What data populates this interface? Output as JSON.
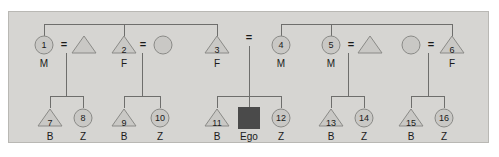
{
  "diagram": {
    "colors": {
      "panel_background": "#d6d5d2",
      "panel_border": "#b9b8b4",
      "shape_fill": "#c9c8c5",
      "shape_stroke": "#8a8a87",
      "ego_fill": "#4a4a4a",
      "line": "#6e6e6c",
      "text": "#1a1a1a"
    },
    "legend": {
      "triangle": "male",
      "circle": "female",
      "filled_square": "ego",
      "equals": "marriage-union"
    },
    "marriage_symbol": "=",
    "generation1": [
      {
        "id": "g1-1",
        "number": "1",
        "kin": "M",
        "shape": "circle",
        "cx": 44,
        "cy": 45
      },
      {
        "id": "g1-s1",
        "number": "",
        "kin": "",
        "shape": "triangle",
        "cx": 84,
        "cy": 45
      },
      {
        "id": "g1-2",
        "number": "2",
        "kin": "F",
        "shape": "triangle",
        "cx": 124,
        "cy": 45
      },
      {
        "id": "g1-s2",
        "number": "",
        "kin": "",
        "shape": "circle",
        "cx": 163,
        "cy": 45
      },
      {
        "id": "g1-3",
        "number": "3",
        "kin": "F",
        "shape": "triangle",
        "cx": 217,
        "cy": 45
      },
      {
        "id": "g1-4",
        "number": "4",
        "kin": "M",
        "shape": "circle",
        "cx": 281,
        "cy": 45
      },
      {
        "id": "g1-5",
        "number": "5",
        "kin": "M",
        "shape": "circle",
        "cx": 331,
        "cy": 45
      },
      {
        "id": "g1-s3",
        "number": "",
        "kin": "",
        "shape": "triangle",
        "cx": 370,
        "cy": 45
      },
      {
        "id": "g1-s4",
        "number": "",
        "kin": "",
        "shape": "circle",
        "cx": 411,
        "cy": 45
      },
      {
        "id": "g1-6",
        "number": "6",
        "kin": "F",
        "shape": "triangle",
        "cx": 452,
        "cy": 45
      }
    ],
    "generation2": [
      {
        "id": "g2-7",
        "number": "7",
        "kin": "B",
        "shape": "triangle",
        "cx": 50,
        "cy": 118
      },
      {
        "id": "g2-8",
        "number": "8",
        "kin": "Z",
        "shape": "circle",
        "cx": 83,
        "cy": 118
      },
      {
        "id": "g2-9",
        "number": "9",
        "kin": "B",
        "shape": "triangle",
        "cx": 124,
        "cy": 118
      },
      {
        "id": "g2-10",
        "number": "10",
        "kin": "Z",
        "shape": "circle",
        "cx": 160,
        "cy": 118
      },
      {
        "id": "g2-11",
        "number": "11",
        "kin": "B",
        "shape": "triangle",
        "cx": 217,
        "cy": 118
      },
      {
        "id": "g2-ego",
        "number": "",
        "kin": "Ego",
        "shape": "square",
        "cx": 249,
        "cy": 118
      },
      {
        "id": "g2-12",
        "number": "12",
        "kin": "Z",
        "shape": "circle",
        "cx": 281,
        "cy": 118
      },
      {
        "id": "g2-13",
        "number": "13",
        "kin": "B",
        "shape": "triangle",
        "cx": 331,
        "cy": 118
      },
      {
        "id": "g2-14",
        "number": "14",
        "kin": "Z",
        "shape": "circle",
        "cx": 364,
        "cy": 118
      },
      {
        "id": "g2-15",
        "number": "15",
        "kin": "B",
        "shape": "triangle",
        "cx": 411,
        "cy": 118
      },
      {
        "id": "g2-16",
        "number": "16",
        "kin": "Z",
        "shape": "circle",
        "cx": 444,
        "cy": 118
      }
    ],
    "unions": [
      {
        "id": "u-1",
        "label": "=",
        "x": 64,
        "y": 45,
        "descent_x": 66,
        "sib_y": 96
      },
      {
        "id": "u-2",
        "label": "=",
        "x": 143,
        "y": 45,
        "descent_x": 142,
        "sib_y": 96
      },
      {
        "id": "u-3",
        "label": "=",
        "x": 249,
        "y": 38,
        "descent_x": 249,
        "sib_y": 96
      },
      {
        "id": "u-4",
        "label": "=",
        "x": 351,
        "y": 45,
        "descent_x": 348,
        "sib_y": 96
      },
      {
        "id": "u-5",
        "label": "=",
        "x": 431,
        "y": 45,
        "descent_x": 428,
        "sib_y": 96
      }
    ],
    "sibling_bars_top": [
      {
        "id": "sb-top-left",
        "x1": 44,
        "x2": 217,
        "y": 24,
        "drops": [
          44,
          124,
          217
        ]
      },
      {
        "id": "sb-top-right",
        "x1": 281,
        "x2": 452,
        "y": 24,
        "drops": [
          281,
          331,
          452
        ]
      }
    ],
    "sibling_bars_bottom": [
      {
        "id": "sb-bot-1",
        "x1": 50,
        "x2": 83,
        "y": 96,
        "drops": [
          50,
          83
        ]
      },
      {
        "id": "sb-bot-2",
        "x1": 124,
        "x2": 160,
        "y": 96,
        "drops": [
          124,
          160
        ]
      },
      {
        "id": "sb-bot-3",
        "x1": 217,
        "x2": 281,
        "y": 96,
        "drops": [
          217,
          249,
          281
        ]
      },
      {
        "id": "sb-bot-4",
        "x1": 331,
        "x2": 364,
        "y": 96,
        "drops": [
          331,
          364
        ]
      },
      {
        "id": "sb-bot-5",
        "x1": 411,
        "x2": 444,
        "y": 96,
        "drops": [
          411,
          444
        ]
      }
    ]
  }
}
